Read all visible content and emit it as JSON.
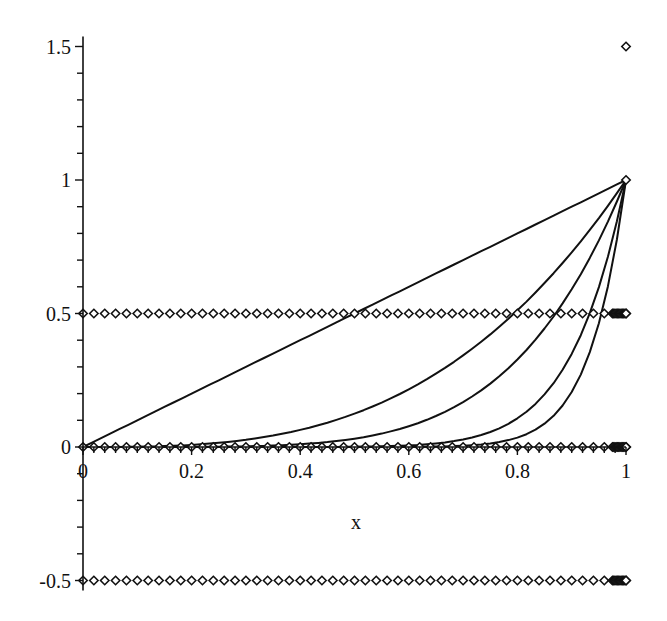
{
  "chart_data": {
    "type": "line",
    "title": "",
    "xlabel": "x",
    "ylabel": "",
    "xlim": [
      0,
      1
    ],
    "ylim": [
      -0.5,
      1.5
    ],
    "grid": false,
    "legend": null,
    "x_ticks": [
      {
        "value": 0,
        "label": "0"
      },
      {
        "value": 0.2,
        "label": "0.2"
      },
      {
        "value": 0.4,
        "label": "0.4"
      },
      {
        "value": 0.6,
        "label": "0.6"
      },
      {
        "value": 0.8,
        "label": "0.8"
      },
      {
        "value": 1,
        "label": "1"
      }
    ],
    "y_ticks": [
      {
        "value": -0.5,
        "label": "-0.5"
      },
      {
        "value": 0,
        "label": "0"
      },
      {
        "value": 0.5,
        "label": "0.5"
      },
      {
        "value": 1,
        "label": "1"
      },
      {
        "value": 1.5,
        "label": "1.5"
      }
    ],
    "x_minor_step": 0.02,
    "y_minor_step": 0.1,
    "series": [
      {
        "name": "x^1",
        "kind": "curve",
        "exponent": 1,
        "color": "#111111"
      },
      {
        "name": "x^3",
        "kind": "curve",
        "exponent": 3,
        "color": "#111111"
      },
      {
        "name": "x^5",
        "kind": "curve",
        "exponent": 5,
        "color": "#111111"
      },
      {
        "name": "x^10",
        "kind": "curve",
        "exponent": 10,
        "color": "#111111"
      },
      {
        "name": "x^15",
        "kind": "curve",
        "exponent": 15,
        "color": "#111111"
      },
      {
        "name": "points y=0.5",
        "kind": "points",
        "y": 0.5,
        "x_step": 0.02,
        "dense_near_1": true,
        "marker": "diamond"
      },
      {
        "name": "points y=0",
        "kind": "points",
        "y": 0,
        "x_step": 0.02,
        "dense_near_1": true,
        "marker": "diamond"
      },
      {
        "name": "points y=-0.5",
        "kind": "points",
        "y": -0.5,
        "x_step": 0.02,
        "dense_near_1": true,
        "marker": "diamond"
      },
      {
        "name": "single point (1, 1.5)",
        "kind": "points",
        "x": [
          1
        ],
        "y": [
          1.5
        ],
        "marker": "diamond"
      },
      {
        "name": "single point (1, 1)",
        "kind": "points",
        "x": [
          1
        ],
        "y": [
          1
        ],
        "marker": "diamond"
      }
    ]
  },
  "axes": {
    "x_label": "x"
  }
}
